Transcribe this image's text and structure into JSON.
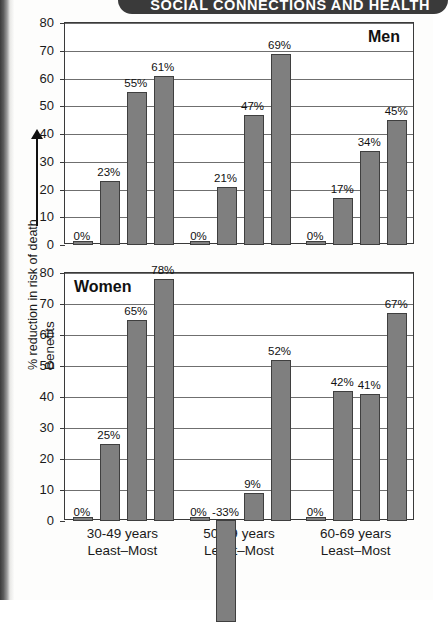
{
  "banner": {
    "title": "SOCIAL CONNECTIONS AND HEALTH"
  },
  "axis_caption": {
    "arrow_label": "Benefits",
    "sub_label": "% reduction in risk of death"
  },
  "chart_data": [
    {
      "type": "bar",
      "title": "Men",
      "xlabel": "",
      "ylabel": "% reduction in risk of death",
      "ylim": [
        0,
        80
      ],
      "yticks": [
        0,
        10,
        20,
        30,
        40,
        50,
        60,
        70,
        80
      ],
      "grid": true,
      "legend": "none",
      "groups": [
        {
          "name": "30-49 years",
          "sub": "Least–Most"
        },
        {
          "name": "50-59 years",
          "sub": "Least–Most"
        },
        {
          "name": "60-69 years",
          "sub": "Least–Most"
        }
      ],
      "categories": [
        "30-49 Least",
        "30-49 b",
        "30-49 c",
        "30-49 Most",
        "50-59 Least",
        "50-59 b",
        "50-59 c",
        "50-59 Most",
        "60-69 Least",
        "60-69 b",
        "60-69 c",
        "60-69 Most"
      ],
      "values": [
        0,
        23,
        55,
        61,
        0,
        21,
        47,
        69,
        0,
        17,
        34,
        45
      ],
      "value_labels": [
        "0%",
        "23%",
        "55%",
        "61%",
        "0%",
        "21%",
        "47%",
        "69%",
        "0%",
        "17%",
        "34%",
        "45%"
      ]
    },
    {
      "type": "bar",
      "title": "Women",
      "xlabel": "",
      "ylabel": "% reduction in risk of death",
      "ylim": [
        0,
        80
      ],
      "yticks": [
        0,
        10,
        20,
        30,
        40,
        50,
        60,
        70,
        80
      ],
      "grid": true,
      "legend": "none",
      "groups": [
        {
          "name": "30-49 years",
          "sub": "Least–Most"
        },
        {
          "name": "50-59 years",
          "sub": "Least–Most"
        },
        {
          "name": "60-69 years",
          "sub": "Least–Most"
        }
      ],
      "categories": [
        "30-49 Least",
        "30-49 b",
        "30-49 c",
        "30-49 Most",
        "50-59 Least",
        "50-59 b",
        "50-59 c",
        "50-59 Most",
        "60-69 Least",
        "60-69 b",
        "60-69 c",
        "60-69 Most"
      ],
      "values": [
        0,
        25,
        65,
        78,
        0,
        -33,
        9,
        52,
        0,
        42,
        41,
        67
      ],
      "value_labels": [
        "0%",
        "25%",
        "65%",
        "78%",
        "0%",
        "-33%",
        "9%",
        "52%",
        "0%",
        "42%",
        "41%",
        "67%"
      ]
    }
  ],
  "colors": {
    "bar_fill": "#7f7f7f",
    "bar_stroke": "#3f3f3f",
    "banner_bg": "#3a3a3a",
    "banner_text": "#ffffff",
    "grid": "#6f6f6f",
    "text": "#1a1a1a"
  }
}
